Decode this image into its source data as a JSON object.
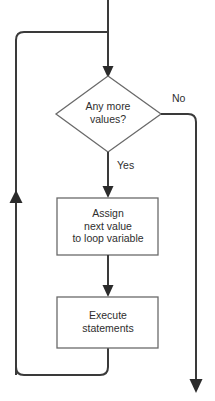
{
  "diagram": {
    "type": "flowchart",
    "title": "",
    "colors": {
      "stroke": "#3a3a3a",
      "text": "#2e2e2e",
      "background": "#ffffff",
      "shape_fill": "#ffffff"
    },
    "nodes": [
      {
        "id": "decision",
        "shape": "diamond",
        "lines": [
          "Any more",
          "values?"
        ],
        "text": "Any more values?"
      },
      {
        "id": "assign",
        "shape": "rectangle",
        "lines": [
          "Assign",
          "next value",
          "to loop variable"
        ],
        "text": "Assign next value to loop variable"
      },
      {
        "id": "execute",
        "shape": "rectangle",
        "lines": [
          "Execute",
          "statements"
        ],
        "text": "Execute statements"
      }
    ],
    "edge_labels": {
      "no": "No",
      "yes": "Yes"
    }
  }
}
